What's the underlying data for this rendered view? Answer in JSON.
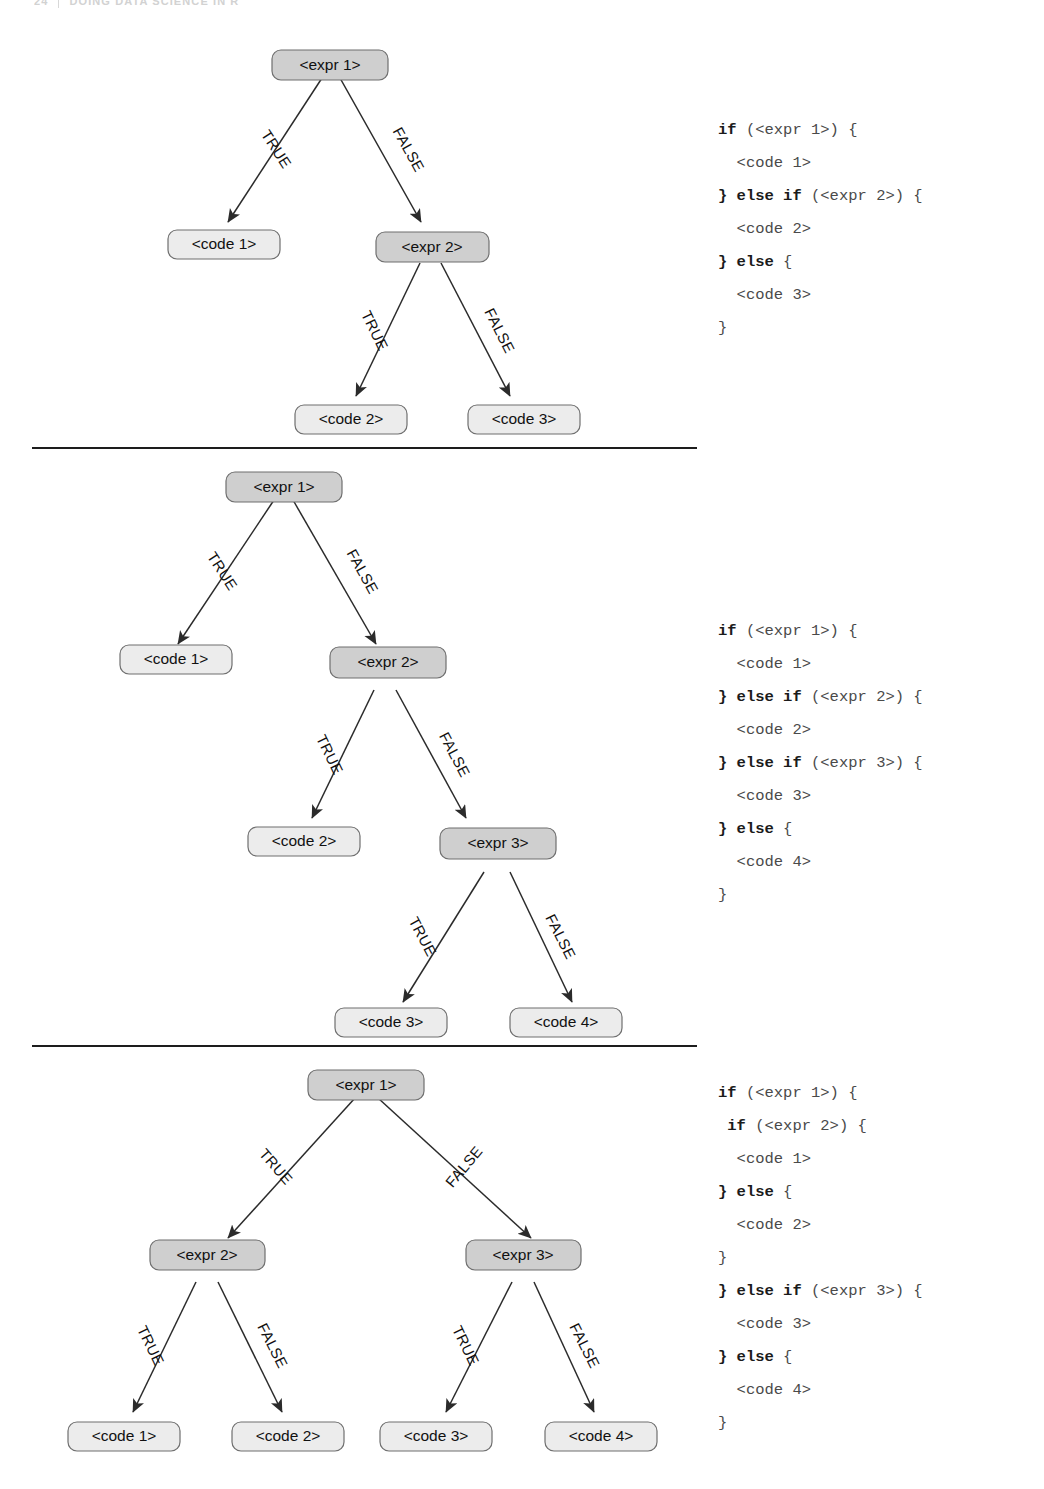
{
  "header": {
    "folio": "24",
    "title": "DOING DATA SCIENCE IN R"
  },
  "colors": {
    "expr_fill": "#cfcfcf",
    "code_fill": "#ececec",
    "node_stroke": "#6f6f6f",
    "edge": "#2b2b2b",
    "divider": "#1d1d1d",
    "code_text": "#4a4a4a",
    "keyword_text": "#1b1b1b"
  },
  "labels": {
    "true": "TRUE",
    "false": "FALSE"
  },
  "figures": [
    {
      "id": "figure-1",
      "nodes": {
        "root": "<expr 1>",
        "true_leaf": "<code 1>",
        "second": "<expr 2>",
        "second_true": "<code 2>",
        "second_false": "<code 3>"
      },
      "code_lines": [
        {
          "kw": "if",
          "rest": " (<expr 1>) {"
        },
        {
          "kw": "",
          "rest": "  <code 1>"
        },
        {
          "kw": "} else if",
          "rest": " (<expr 2>) {",
          "lead": ""
        },
        {
          "kw": "",
          "rest": "  <code 2>"
        },
        {
          "kw": "} else",
          "rest": " {"
        },
        {
          "kw": "",
          "rest": "  <code 3>"
        },
        {
          "kw": "",
          "rest": "}"
        }
      ]
    },
    {
      "id": "figure-2",
      "nodes": {
        "root": "<expr 1>",
        "true_leaf": "<code 1>",
        "second": "<expr 2>",
        "second_true": "<code 2>",
        "third": "<expr 3>",
        "third_true": "<code 3>",
        "third_false": "<code 4>"
      },
      "code_lines": [
        {
          "kw": "if",
          "rest": " (<expr 1>) {"
        },
        {
          "kw": "",
          "rest": "  <code 1>"
        },
        {
          "kw": "} else if",
          "rest": " (<expr 2>) {"
        },
        {
          "kw": "",
          "rest": "  <code 2>"
        },
        {
          "kw": "} else if",
          "rest": " (<expr 3>) {"
        },
        {
          "kw": "",
          "rest": "  <code 3>"
        },
        {
          "kw": "} else",
          "rest": " {"
        },
        {
          "kw": "",
          "rest": "  <code 4>"
        },
        {
          "kw": "",
          "rest": "}"
        }
      ]
    },
    {
      "id": "figure-3",
      "nodes": {
        "root": "<expr 1>",
        "left": "<expr 2>",
        "right": "<expr 3>",
        "left_true": "<code 1>",
        "left_false": "<code 2>",
        "right_true": "<code 3>",
        "right_false": "<code 4>"
      },
      "code_lines": [
        {
          "kw": "if",
          "rest": " (<expr 1>) {"
        },
        {
          "kw": " if",
          "rest": " (<expr 2>) {"
        },
        {
          "kw": "",
          "rest": "  <code 1>"
        },
        {
          "kw": "} else",
          "rest": " {"
        },
        {
          "kw": "",
          "rest": "  <code 2>"
        },
        {
          "kw": "",
          "rest": "}"
        },
        {
          "kw": "} else if",
          "rest": " (<expr 3>) {"
        },
        {
          "kw": "",
          "rest": "  <code 3>"
        },
        {
          "kw": "} else",
          "rest": " {"
        },
        {
          "kw": "",
          "rest": "  <code 4>"
        },
        {
          "kw": "",
          "rest": "}"
        }
      ]
    }
  ]
}
